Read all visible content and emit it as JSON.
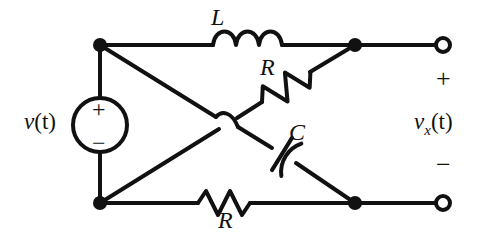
{
  "figure": {
    "kind": "circuit-schematic",
    "stroke_color": "#111111",
    "background_color": "#ffffff"
  },
  "labels": {
    "inductor": "L",
    "resistor_diagonal": "R",
    "capacitor": "C",
    "resistor_bottom": "R",
    "source_voltage": "v(t)",
    "source_voltage_var": "v",
    "source_voltage_arg": "(t)",
    "output_voltage_var": "v",
    "output_voltage_sub": "x",
    "output_voltage_arg": "(t)",
    "output_voltage": "v_x(t)"
  },
  "polarity": {
    "source_plus": "+",
    "source_minus": "−",
    "terminal_plus": "+",
    "terminal_minus": "−"
  },
  "components": [
    {
      "name": "inductor-L",
      "type": "inductor",
      "label": "L",
      "branch": "top-left-node to top-right-node",
      "coils": 3
    },
    {
      "name": "resistor-R-diagonal",
      "type": "resistor",
      "label": "R",
      "branch": "bottom-left-node to top-right-node",
      "zigzags": 3
    },
    {
      "name": "capacitor-C",
      "type": "capacitor",
      "label": "C",
      "branch": "top-left-node to bottom-right-node",
      "style": "curved-plate"
    },
    {
      "name": "resistor-R-bottom",
      "type": "resistor",
      "label": "R",
      "branch": "bottom-left-node to bottom-right-node",
      "zigzags": 3
    },
    {
      "name": "voltage-source",
      "type": "independent-voltage-source",
      "label": "v(t)",
      "branch": "left vertical",
      "plus": "top",
      "minus": "bottom"
    }
  ],
  "nodes": [
    {
      "name": "top-left-node",
      "x": 100,
      "y": 45,
      "filled": true
    },
    {
      "name": "bottom-left-node",
      "x": 100,
      "y": 203,
      "filled": true
    },
    {
      "name": "top-right-node",
      "x": 355,
      "y": 45,
      "filled": true
    },
    {
      "name": "bottom-right-node",
      "x": 355,
      "y": 203,
      "filled": true
    },
    {
      "name": "output-terminal-positive",
      "x": 443,
      "y": 45,
      "filled": false
    },
    {
      "name": "output-terminal-negative",
      "x": 443,
      "y": 203,
      "filled": false
    }
  ],
  "crossing": {
    "name": "wire-hop",
    "x": 228,
    "y": 122,
    "connected": false
  }
}
